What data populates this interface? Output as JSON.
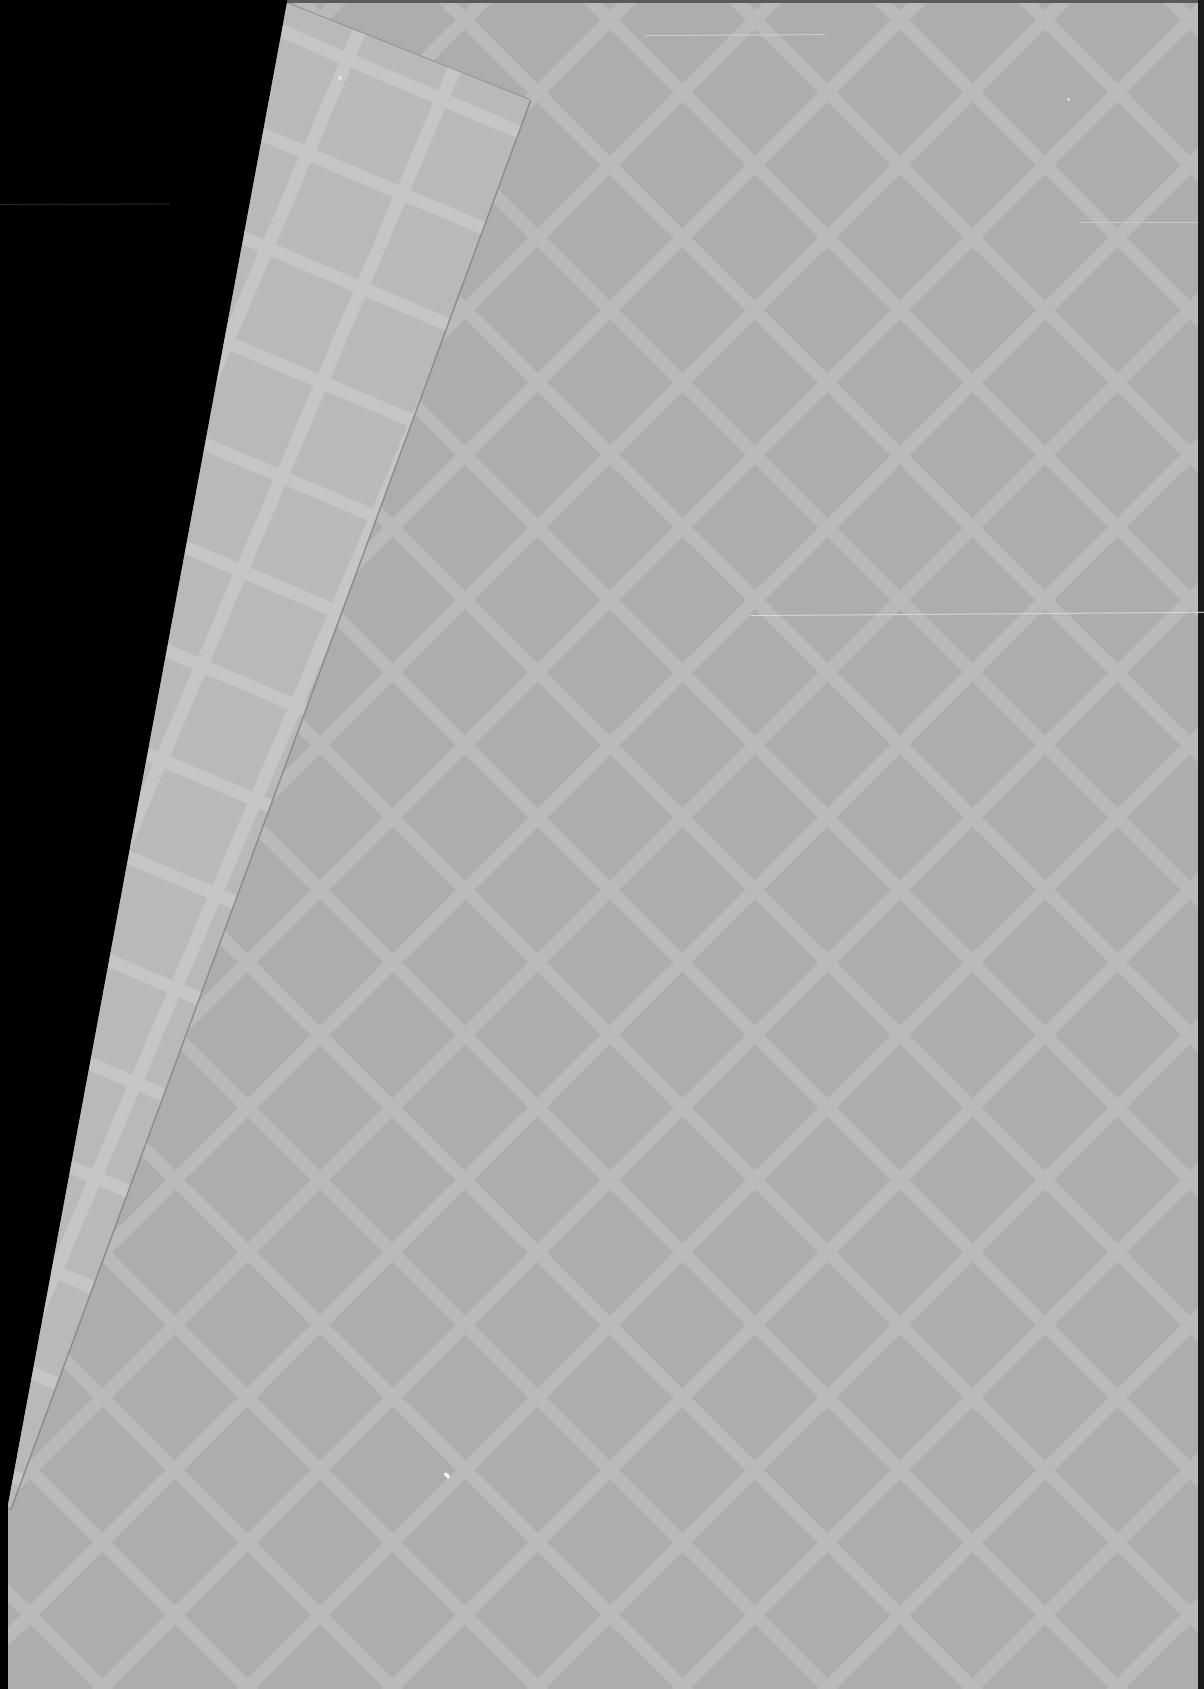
{
  "scene": {
    "description": "Scanned sheet of grey paper with a diamond lattice watermark pattern, top-left corner folded over, on a black background",
    "canvas": {
      "width": 1204,
      "height": 1689
    },
    "colors": {
      "background": "#000000",
      "main_sheet": "#adadad",
      "flap": "#b8b8b8",
      "lattice_line_main": "#bdbdbd",
      "lattice_line_flap": "#c6c6c6",
      "fold_shadow": "#8f8f8f",
      "edge_strip": "#1a1a1a",
      "scratch": "#d4d4d4"
    },
    "lattice": {
      "spacing_px": 145,
      "line_width_px": 14,
      "angle_deg": 45
    },
    "scratches": [
      {
        "x": 645,
        "y": 35,
        "length": 180,
        "angle": -0.3
      },
      {
        "x": 750,
        "y": 615,
        "length": 455,
        "angle": -0.4
      },
      {
        "x": 1080,
        "y": 222,
        "length": 120,
        "angle": 0
      },
      {
        "x": 0,
        "y": 204,
        "length": 170,
        "angle": -0.2
      }
    ],
    "specks": [
      {
        "x": 340,
        "y": 78,
        "r": 2
      },
      {
        "x": 448,
        "y": 1474,
        "r": 3
      },
      {
        "x": 1068,
        "y": 99,
        "r": 2
      }
    ]
  }
}
